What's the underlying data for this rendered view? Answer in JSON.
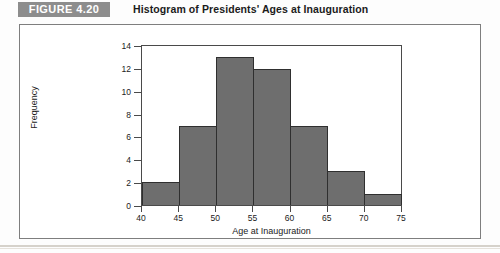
{
  "header": {
    "badge_label": "FIGURE 4.20",
    "title": "Histogram of Presidents' Ages at Inauguration",
    "badge_color": "#8d8d8d",
    "badge_text_color": "#ffffff"
  },
  "chart_data": {
    "type": "bar",
    "title": "Histogram of Presidents' Ages at Inauguration",
    "xlabel": "Age at Inauguration",
    "ylabel": "Frequency",
    "bin_width": 5,
    "bin_edges": [
      40,
      45,
      50,
      55,
      60,
      65,
      70,
      75
    ],
    "categories": [
      "40-45",
      "45-50",
      "50-55",
      "55-60",
      "60-65",
      "65-70",
      "70-75"
    ],
    "values": [
      2,
      7,
      13,
      12,
      7,
      3,
      1
    ],
    "xlim": [
      40,
      75
    ],
    "ylim": [
      0,
      14
    ],
    "xticks": [
      "40",
      "45",
      "50",
      "55",
      "60",
      "65",
      "70",
      "75"
    ],
    "yticks": [
      "0",
      "2",
      "4",
      "6",
      "8",
      "10",
      "12",
      "14"
    ],
    "grid": false,
    "legend": null,
    "bar_color": "#6e6e6e",
    "bar_edge_color": "#2f2f2f",
    "plot_bg": "#ffffff"
  }
}
